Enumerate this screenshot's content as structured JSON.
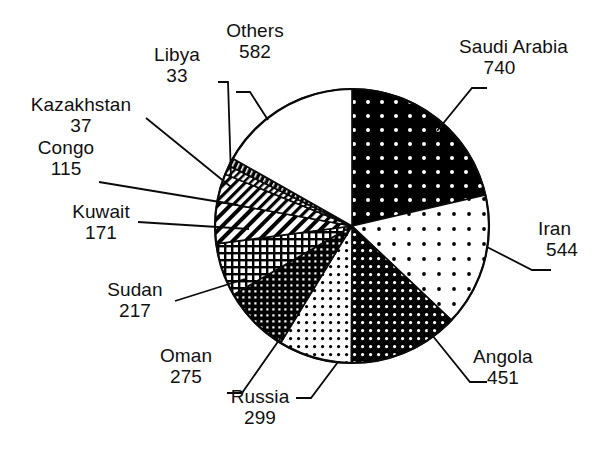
{
  "chart_data": {
    "type": "pie",
    "title": "",
    "subtitle": "",
    "xlabel": "",
    "ylabel": "",
    "legend_position": "none",
    "grid": false,
    "total": 3464,
    "start_angle_deg": 0,
    "direction": "clockwise",
    "categories": [
      "Saudi Arabia",
      "Iran",
      "Angola",
      "Russia",
      "Oman",
      "Sudan",
      "Kuwait",
      "Congo",
      "Kazakhstan",
      "Libya",
      "Others"
    ],
    "values": [
      740,
      544,
      451,
      299,
      275,
      217,
      171,
      115,
      37,
      33,
      582
    ],
    "slices": [
      {
        "label": "Saudi Arabia",
        "value": 740,
        "value_text": "740",
        "fill": "black-white-dots",
        "sweep_deg": 76.9
      },
      {
        "label": "Iran",
        "value": 544,
        "value_text": "544",
        "fill": "white-sparse-black-dots",
        "sweep_deg": 56.5
      },
      {
        "label": "Angola",
        "value": 451,
        "value_text": "451",
        "fill": "black-dense-white-dots",
        "sweep_deg": 46.9
      },
      {
        "label": "Russia",
        "value": 299,
        "value_text": "299",
        "fill": "white-dense-black-dots",
        "sweep_deg": 31.1
      },
      {
        "label": "Oman",
        "value": 275,
        "value_text": "275",
        "fill": "dark-crosshatch-grid",
        "sweep_deg": 28.6
      },
      {
        "label": "Sudan",
        "value": 217,
        "value_text": "217",
        "fill": "medium-crosshatch-grid",
        "sweep_deg": 22.6
      },
      {
        "label": "Kuwait",
        "value": 171,
        "value_text": "171",
        "fill": "diagonal-hatch-wide",
        "sweep_deg": 17.8
      },
      {
        "label": "Congo",
        "value": 115,
        "value_text": "115",
        "fill": "diagonal-hatch-medium",
        "sweep_deg": 12.0
      },
      {
        "label": "Kazakhstan",
        "value": 37,
        "value_text": "37",
        "fill": "diagonal-hatch-fine",
        "sweep_deg": 3.8
      },
      {
        "label": "Libya",
        "value": 33,
        "value_text": "33",
        "fill": "solid-black-ticks",
        "sweep_deg": 3.4
      },
      {
        "label": "Others",
        "value": 582,
        "value_text": "582",
        "fill": "white-plain",
        "sweep_deg": 60.5
      }
    ]
  },
  "labels": {
    "saudi_arabia": {
      "name": "Saudi Arabia",
      "value": "740"
    },
    "iran": {
      "name": "Iran",
      "value": "544"
    },
    "angola": {
      "name": "Angola",
      "value": "451"
    },
    "russia": {
      "name": "Russia",
      "value": "299"
    },
    "oman": {
      "name": "Oman",
      "value": "275"
    },
    "sudan": {
      "name": "Sudan",
      "value": "217"
    },
    "kuwait": {
      "name": "Kuwait",
      "value": "171"
    },
    "congo": {
      "name": "Congo",
      "value": "115"
    },
    "kazakhstan": {
      "name": "Kazakhstan",
      "value": "37"
    },
    "libya": {
      "name": "Libya",
      "value": "33"
    },
    "others": {
      "name": "Others",
      "value": "582"
    }
  },
  "colors": {
    "ink": "#0a0a0a",
    "paper": "#ffffff"
  }
}
